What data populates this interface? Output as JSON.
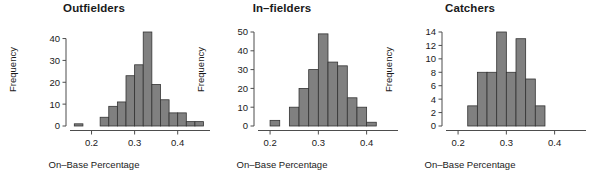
{
  "figure": {
    "width": 564,
    "height": 178,
    "background": "#ffffff",
    "bar_fill": "#808080",
    "bar_stroke": "#333333",
    "axis_color": "#4d4d4d",
    "text_color": "#1a1a1a"
  },
  "panels": [
    {
      "title": "Outfielders",
      "ylabel": "Frequency",
      "xlabel": "On–Base Percentage"
    },
    {
      "title": "In–fielders",
      "ylabel": "Frequency",
      "xlabel": "On–Base Percentage"
    },
    {
      "title": "Catchers",
      "ylabel": "Frequency",
      "xlabel": "On–Base Percentage"
    }
  ],
  "chart_data": [
    {
      "type": "bar",
      "title": "Outfielders",
      "xlabel": "On–Base Percentage",
      "ylabel": "Frequency",
      "bin_width": 0.02,
      "bin_edges": [
        0.16,
        0.18,
        0.2,
        0.22,
        0.24,
        0.26,
        0.28,
        0.3,
        0.32,
        0.34,
        0.36,
        0.38,
        0.4,
        0.42,
        0.44,
        0.46
      ],
      "categories": [
        "0.16-0.18",
        "0.18-0.20",
        "0.20-0.22",
        "0.22-0.24",
        "0.24-0.26",
        "0.26-0.28",
        "0.28-0.30",
        "0.30-0.32",
        "0.32-0.34",
        "0.34-0.36",
        "0.36-0.38",
        "0.38-0.40",
        "0.40-0.42",
        "0.42-0.44",
        "0.44-0.46"
      ],
      "values": [
        1,
        0,
        0,
        4,
        9,
        11,
        23,
        28,
        43,
        19,
        12,
        6,
        6,
        2,
        2
      ],
      "xlim": [
        0.15,
        0.475
      ],
      "ylim": [
        0,
        43
      ],
      "xticks": [
        0.2,
        0.3,
        0.4
      ],
      "xticklabels": [
        "0.2",
        "0.3",
        "0.4"
      ],
      "yticks": [
        0,
        10,
        20,
        30,
        40
      ],
      "yticklabels": [
        "0",
        "10",
        "20",
        "30",
        "40"
      ],
      "grid": false,
      "legend": false
    },
    {
      "type": "bar",
      "title": "In–fielders",
      "xlabel": "On–Base Percentage",
      "ylabel": "Frequency",
      "bin_width": 0.02,
      "bin_edges": [
        0.2,
        0.22,
        0.24,
        0.26,
        0.28,
        0.3,
        0.32,
        0.34,
        0.36,
        0.38,
        0.4,
        0.42
      ],
      "categories": [
        "0.20-0.22",
        "0.22-0.24",
        "0.24-0.26",
        "0.26-0.28",
        "0.28-0.30",
        "0.30-0.32",
        "0.32-0.34",
        "0.34-0.36",
        "0.36-0.38",
        "0.38-0.40",
        "0.40-0.42"
      ],
      "values": [
        3,
        0,
        10,
        20,
        30,
        49,
        34,
        32,
        15,
        10,
        2
      ],
      "xlim": [
        0.175,
        0.465
      ],
      "ylim": [
        0,
        50
      ],
      "xticks": [
        0.2,
        0.3,
        0.4
      ],
      "xticklabels": [
        "0.2",
        "0.3",
        "0.4"
      ],
      "yticks": [
        0,
        10,
        20,
        30,
        40,
        50
      ],
      "yticklabels": [
        "0",
        "10",
        "20",
        "30",
        "40",
        "50"
      ],
      "grid": false,
      "legend": false
    },
    {
      "type": "bar",
      "title": "Catchers",
      "xlabel": "On–Base Percentage",
      "ylabel": "Frequency",
      "bin_width": 0.02,
      "bin_edges": [
        0.22,
        0.24,
        0.26,
        0.28,
        0.3,
        0.32,
        0.34,
        0.36,
        0.38
      ],
      "categories": [
        "0.22-0.24",
        "0.24-0.26",
        "0.26-0.28",
        "0.28-0.30",
        "0.30-0.32",
        "0.32-0.34",
        "0.34-0.36",
        "0.36-0.38"
      ],
      "values": [
        3,
        8,
        8,
        14,
        8,
        13,
        7,
        3
      ],
      "xlim": [
        0.175,
        0.465
      ],
      "ylim": [
        0,
        14
      ],
      "xticks": [
        0.2,
        0.3,
        0.4
      ],
      "xticklabels": [
        "0.2",
        "0.3",
        "0.4"
      ],
      "yticks": [
        0,
        2,
        4,
        6,
        8,
        10,
        12,
        14
      ],
      "yticklabels": [
        "0",
        "2",
        "4",
        "6",
        "8",
        "10",
        "12",
        "14"
      ],
      "grid": false,
      "legend": false
    }
  ]
}
